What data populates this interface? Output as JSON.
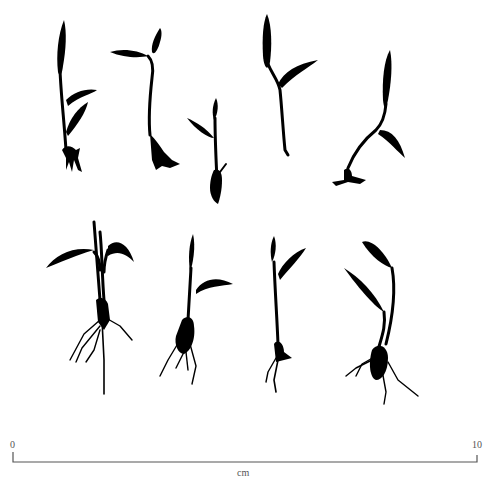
{
  "figure": {
    "type": "botanical specimen illustration",
    "specimen_count": 9,
    "rows": [
      {
        "row": "top",
        "specimens": 5
      },
      {
        "row": "bottom",
        "specimens": 4
      }
    ],
    "ink_color": "#000000",
    "background": "#ffffff"
  },
  "scale_bar": {
    "start_label": "0",
    "end_label": "10",
    "unit_label": "cm",
    "color": "#555555"
  }
}
